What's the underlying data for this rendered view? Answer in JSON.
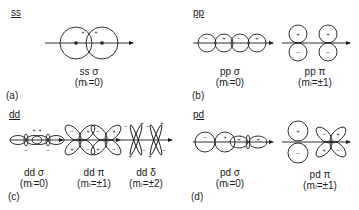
{
  "figure": {
    "panels": [
      {
        "id": "a",
        "title": "ss",
        "label": "(a)",
        "bonds": [
          {
            "name": "ss σ",
            "m": "(mₗ=0)",
            "signs": [
              "+",
              "+"
            ]
          }
        ]
      },
      {
        "id": "b",
        "title": "pp",
        "label": "(b)",
        "bonds": [
          {
            "name": "pp σ",
            "m": "(mₗ=0)",
            "signs": [
              "−",
              "+",
              "−",
              "+"
            ]
          },
          {
            "name": "pp π",
            "m": "(mₗ=±1)",
            "signs": [
              "+",
              "−",
              "+",
              "−"
            ]
          }
        ]
      },
      {
        "id": "c",
        "title": "dd",
        "label": "(c)",
        "bonds": [
          {
            "name": "dd σ",
            "m": "(mₗ=0)",
            "signs": [
              "+",
              "+",
              "−",
              "−"
            ]
          },
          {
            "name": "dd π",
            "m": "(mₗ=±1)",
            "signs": [
              "−",
              "+",
              "+",
              "−",
              "−",
              "+",
              "+",
              "−"
            ]
          },
          {
            "name": "dd δ",
            "m": "(mₗ=±2)",
            "signs": [
              "−",
              "+",
              "+",
              "−",
              "−",
              "+",
              "+",
              "−"
            ]
          }
        ]
      },
      {
        "id": "d",
        "title": "pd",
        "label": "(d)",
        "bonds": [
          {
            "name": "pd σ",
            "m": "(mₗ=0)",
            "signs": [
              "−",
              "+",
              "+",
              "+"
            ]
          },
          {
            "name": "pd π",
            "m": "(mₗ=±1)",
            "signs": [
              "+",
              "−",
              "−",
              "+",
              "+",
              "−"
            ]
          }
        ]
      }
    ],
    "colors": {
      "stroke": "#1a1a1a",
      "background": "#ffffff"
    }
  }
}
